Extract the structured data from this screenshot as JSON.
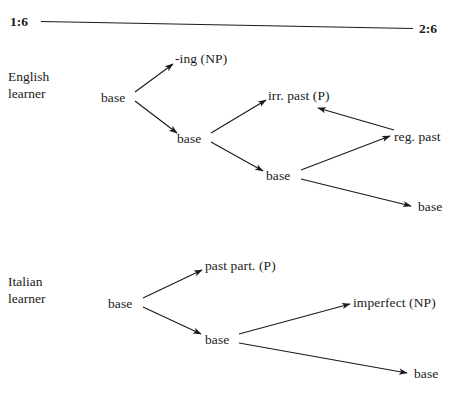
{
  "figure": {
    "background_color": "#ffffff",
    "ink_color": "#1a1a1a",
    "scale": {
      "left_label": "1:6",
      "right_label": "2:6"
    },
    "sections": [
      {
        "id": "english",
        "label_line1": "English",
        "label_line2": "learner",
        "nodes": [
          {
            "id": "en-base-1",
            "text": "base"
          },
          {
            "id": "en-ing",
            "text": "-ing (NP)"
          },
          {
            "id": "en-base-2",
            "text": "base"
          },
          {
            "id": "en-irr-past",
            "text": "irr. past (P)"
          },
          {
            "id": "en-base-3",
            "text": "base"
          },
          {
            "id": "en-reg-past",
            "text": "reg. past"
          },
          {
            "id": "en-base-4",
            "text": "base"
          }
        ]
      },
      {
        "id": "italian",
        "label_line1": "Italian",
        "label_line2": "learner",
        "nodes": [
          {
            "id": "it-base-1",
            "text": "base"
          },
          {
            "id": "it-past-part",
            "text": "past part. (P)"
          },
          {
            "id": "it-base-2",
            "text": "base"
          },
          {
            "id": "it-imperfect",
            "text": "imperfect (NP)"
          },
          {
            "id": "it-base-3",
            "text": "base"
          }
        ]
      }
    ]
  }
}
